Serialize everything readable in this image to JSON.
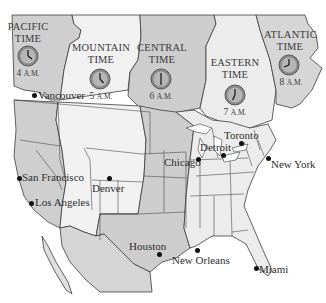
{
  "map": {
    "title": "North American Time Zones",
    "colors": {
      "pacific": "#cfcfcf",
      "mountain": "#f1f1f1",
      "central": "#cdcdcd",
      "eastern": "#ececec",
      "atlantic": "#d6d6d6",
      "border": "#3c3c3c",
      "water": "#ffffff",
      "text": "#333333"
    },
    "zones": [
      {
        "id": "pacific",
        "label_line1": "PACIFIC",
        "label_line2": "TIME",
        "time": "4",
        "ampm": "A.M."
      },
      {
        "id": "mountain",
        "label_line1": "MOUNTAIN",
        "label_line2": "TIME",
        "time": "5",
        "ampm": "A.M."
      },
      {
        "id": "central",
        "label_line1": "CENTRAL",
        "label_line2": "TIME",
        "time": "6",
        "ampm": "A.M."
      },
      {
        "id": "eastern",
        "label_line1": "EASTERN",
        "label_line2": "TIME",
        "time": "7",
        "ampm": "A.M."
      },
      {
        "id": "atlantic",
        "label_line1": "ATLANTIC",
        "label_line2": "TIME",
        "time": "8",
        "ampm": "A.M."
      }
    ],
    "cities": [
      {
        "name": "Vancouver"
      },
      {
        "name": "San Francisco"
      },
      {
        "name": "Los Angeles"
      },
      {
        "name": "Denver"
      },
      {
        "name": "Chicago"
      },
      {
        "name": "Detroit"
      },
      {
        "name": "Toronto"
      },
      {
        "name": "New York"
      },
      {
        "name": "Houston"
      },
      {
        "name": "New Orleans"
      },
      {
        "name": "Miami"
      }
    ]
  }
}
